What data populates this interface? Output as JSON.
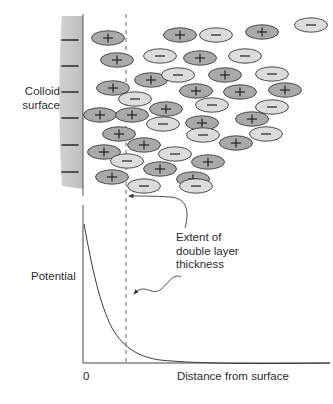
{
  "figure": {
    "type": "scientific-diagram",
    "surface": {
      "label_line1": "Colloid",
      "label_line2": "surface",
      "charge_symbol": "−",
      "charge_count": 6,
      "fill_color": "#cccccc",
      "edge_color": "#000000"
    },
    "annotations": {
      "extent_line1": "Extent of",
      "extent_line2": "double layer",
      "extent_line3": "thickness",
      "dashed_line_color": "#555555"
    },
    "ions": {
      "positive_symbol": "+",
      "positive_fill": "#a9a9a9",
      "negative_symbol": "−",
      "negative_fill": "#dcdcdc",
      "outline": "#3a3a3a",
      "positive_count": 26,
      "negative_count": 20,
      "items": [
        {
          "x": 108,
          "y": 38,
          "charge": "+"
        },
        {
          "x": 180,
          "y": 35,
          "charge": "+"
        },
        {
          "x": 216,
          "y": 35,
          "charge": "-"
        },
        {
          "x": 262,
          "y": 32,
          "charge": "+"
        },
        {
          "x": 311,
          "y": 25,
          "charge": "-"
        },
        {
          "x": 117,
          "y": 60,
          "charge": "+"
        },
        {
          "x": 160,
          "y": 56,
          "charge": "-"
        },
        {
          "x": 200,
          "y": 58,
          "charge": "+"
        },
        {
          "x": 245,
          "y": 56,
          "charge": "-"
        },
        {
          "x": 151,
          "y": 80,
          "charge": "+"
        },
        {
          "x": 178,
          "y": 75,
          "charge": "-"
        },
        {
          "x": 225,
          "y": 75,
          "charge": "+"
        },
        {
          "x": 272,
          "y": 74,
          "charge": "-"
        },
        {
          "x": 113,
          "y": 88,
          "charge": "+"
        },
        {
          "x": 135,
          "y": 99,
          "charge": "-"
        },
        {
          "x": 196,
          "y": 91,
          "charge": "+"
        },
        {
          "x": 240,
          "y": 92,
          "charge": "+"
        },
        {
          "x": 285,
          "y": 90,
          "charge": "+"
        },
        {
          "x": 100,
          "y": 115,
          "charge": "+"
        },
        {
          "x": 132,
          "y": 115,
          "charge": "+"
        },
        {
          "x": 166,
          "y": 109,
          "charge": "+"
        },
        {
          "x": 212,
          "y": 105,
          "charge": "-"
        },
        {
          "x": 272,
          "y": 107,
          "charge": "-"
        },
        {
          "x": 163,
          "y": 124,
          "charge": "-"
        },
        {
          "x": 202,
          "y": 123,
          "charge": "+"
        },
        {
          "x": 252,
          "y": 119,
          "charge": "+"
        },
        {
          "x": 119,
          "y": 134,
          "charge": "+"
        },
        {
          "x": 203,
          "y": 135,
          "charge": "-"
        },
        {
          "x": 266,
          "y": 134,
          "charge": "-"
        },
        {
          "x": 144,
          "y": 145,
          "charge": "+"
        },
        {
          "x": 236,
          "y": 143,
          "charge": "+"
        },
        {
          "x": 104,
          "y": 152,
          "charge": "+"
        },
        {
          "x": 175,
          "y": 154,
          "charge": "-"
        },
        {
          "x": 127,
          "y": 161,
          "charge": "-"
        },
        {
          "x": 208,
          "y": 162,
          "charge": "+"
        },
        {
          "x": 160,
          "y": 169,
          "charge": "+"
        },
        {
          "x": 112,
          "y": 177,
          "charge": "+"
        },
        {
          "x": 193,
          "y": 179,
          "charge": "+"
        },
        {
          "x": 144,
          "y": 186,
          "charge": "-"
        },
        {
          "x": 196,
          "y": 186,
          "charge": "-"
        }
      ]
    },
    "chart": {
      "ylabel": "Potential",
      "xlabel": "Distance from surface",
      "origin_tick": "0",
      "curve": "exponential-decay",
      "axis_color": "#444444"
    }
  }
}
